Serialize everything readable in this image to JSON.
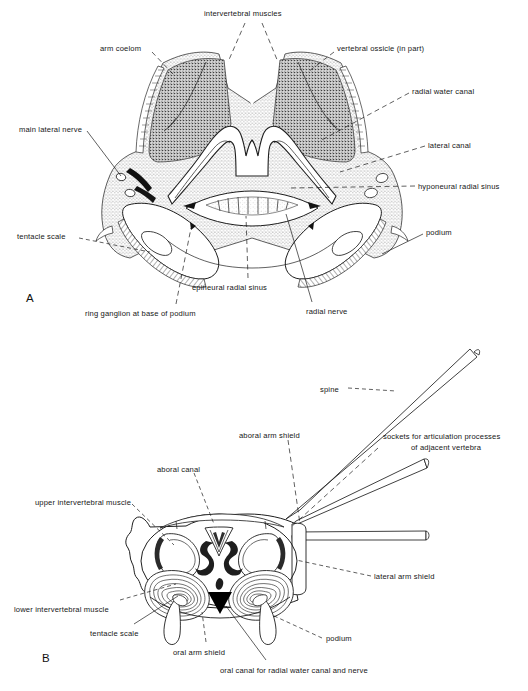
{
  "figure": {
    "background_color": "#ffffff",
    "ink_color": "#1a1a1a",
    "shade_dark": "#6a6a6a",
    "shade_mid": "#9a9a9a",
    "shade_light": "#c8c8c8"
  },
  "panels": [
    {
      "letter": "A",
      "name": "panel-a",
      "description": "transverse section through brittle star arm",
      "letter_pos": {
        "x": 26,
        "y": 292
      },
      "labels": [
        {
          "id": "intervertebral-muscles",
          "text": "intervertebral muscles",
          "x": 204,
          "y": 9,
          "align": "left"
        },
        {
          "id": "arm-coelom",
          "text": "arm coelom",
          "x": 100,
          "y": 44,
          "align": "left"
        },
        {
          "id": "vertebral-ossicle",
          "text": "vertebral ossicle (in part)",
          "x": 337,
          "y": 44,
          "align": "left"
        },
        {
          "id": "radial-water-canal",
          "text": "radial water canal",
          "x": 412,
          "y": 87,
          "align": "left"
        },
        {
          "id": "main-lateral-nerve",
          "text": "main lateral nerve",
          "x": 19,
          "y": 125,
          "align": "left"
        },
        {
          "id": "lateral-canal",
          "text": "lateral canal",
          "x": 428,
          "y": 141,
          "align": "left"
        },
        {
          "id": "hyponeural-radial-sinus",
          "text": "hyponeural radial sinus",
          "x": 418,
          "y": 182,
          "align": "left"
        },
        {
          "id": "tentacle-scale-a",
          "text": "tentacle scale",
          "x": 17,
          "y": 232,
          "align": "left"
        },
        {
          "id": "podium-a",
          "text": "podium",
          "x": 426,
          "y": 228,
          "align": "left"
        },
        {
          "id": "epineural-radial-sinus",
          "text": "epineural radial sinus",
          "x": 192,
          "y": 283,
          "align": "left"
        },
        {
          "id": "radial-nerve",
          "text": "radial nerve",
          "x": 306,
          "y": 307,
          "align": "left"
        },
        {
          "id": "ring-ganglion",
          "text": "ring ganglion at base of podium",
          "x": 85,
          "y": 309,
          "align": "left"
        }
      ]
    },
    {
      "letter": "B",
      "name": "panel-b",
      "description": "aboral view of isolated vertebral ossicle with arm shields and spines",
      "letter_pos": {
        "x": 42,
        "y": 652
      },
      "labels": [
        {
          "id": "spine",
          "text": "spine",
          "x": 320,
          "y": 385,
          "align": "left"
        },
        {
          "id": "aboral-arm-shield",
          "text": "aboral arm shield",
          "x": 239,
          "y": 431,
          "align": "left"
        },
        {
          "id": "sockets-line1",
          "text": "sockets for articulation processes",
          "x": 383,
          "y": 432,
          "align": "left"
        },
        {
          "id": "sockets-line2",
          "text": "of adjacent vertebra",
          "x": 411,
          "y": 443,
          "align": "left"
        },
        {
          "id": "aboral-canal",
          "text": "aboral canal",
          "x": 157,
          "y": 465,
          "align": "left"
        },
        {
          "id": "upper-intervertebral-muscle",
          "text": "upper intervertebral muscle",
          "x": 35,
          "y": 498,
          "align": "left"
        },
        {
          "id": "lateral-arm-shield",
          "text": "lateral arm shield",
          "x": 374,
          "y": 572,
          "align": "left"
        },
        {
          "id": "lower-intervertebral-muscle",
          "text": "lower intervertebral muscle",
          "x": 14,
          "y": 605,
          "align": "left"
        },
        {
          "id": "tentacle-scale-b",
          "text": "tentacle scale",
          "x": 90,
          "y": 629,
          "align": "left"
        },
        {
          "id": "podium-b",
          "text": "podium",
          "x": 326,
          "y": 634,
          "align": "left"
        },
        {
          "id": "oral-arm-shield",
          "text": "oral arm shield",
          "x": 173,
          "y": 648,
          "align": "left"
        },
        {
          "id": "oral-canal",
          "text": "oral canal for radial water canal and nerve",
          "x": 220,
          "y": 666,
          "align": "left"
        }
      ]
    }
  ]
}
